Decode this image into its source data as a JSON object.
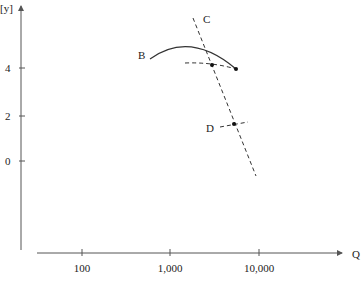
{
  "diagram": {
    "y_axis": {
      "label": "[y]",
      "ticks": [
        {
          "label": "4",
          "y": 68
        },
        {
          "label": "2",
          "y": 116
        },
        {
          "label": "0",
          "y": 161
        }
      ]
    },
    "x_axis": {
      "label": "Q",
      "ticks": [
        {
          "label": "100",
          "x": 82
        },
        {
          "label": "1,000",
          "x": 170
        },
        {
          "label": "10,000",
          "x": 259
        }
      ]
    },
    "curves": {
      "B": {
        "label": "B"
      },
      "C": {
        "label": "C"
      },
      "D": {
        "label": "D"
      }
    },
    "caption": "",
    "colors": {
      "line": "#333333",
      "axis": "#555555",
      "text": "#222222"
    }
  }
}
